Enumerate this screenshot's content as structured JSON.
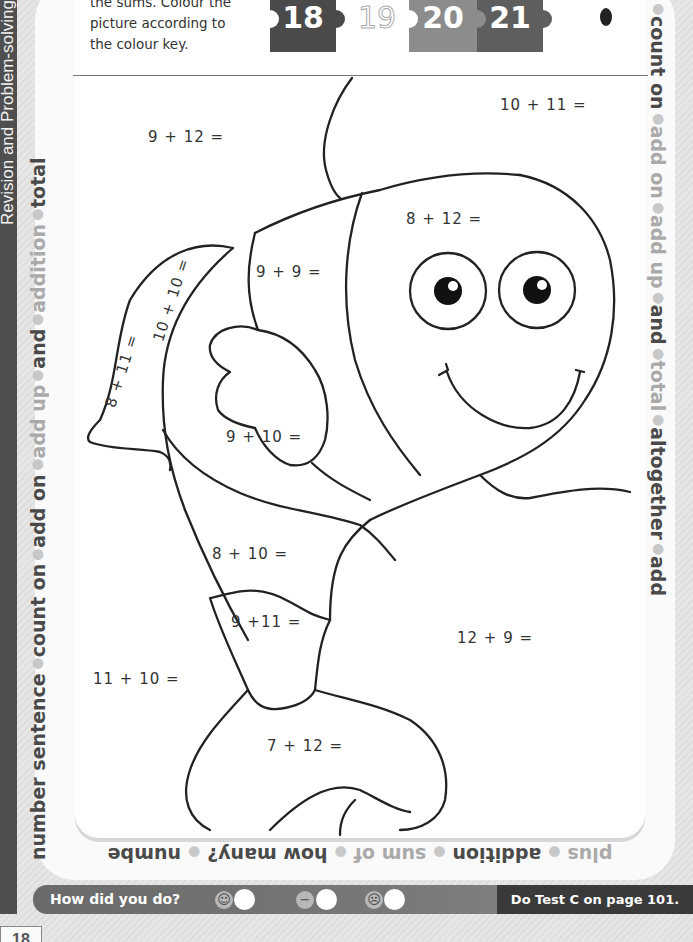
{
  "page": {
    "section_title": "Revision and Problem-solving",
    "page_number": "18"
  },
  "instructions": {
    "text_line1": "the sums. Colour the",
    "text_line2": "picture according to",
    "text_line3": "the colour key."
  },
  "colour_key": [
    {
      "value": "18",
      "color": "#4a4a4a",
      "style": "filled"
    },
    {
      "value": "19",
      "color": "#ffffff",
      "style": "outline"
    },
    {
      "value": "20",
      "color": "#8c8c8c",
      "style": "filled"
    },
    {
      "value": "21",
      "color": "#5e5e5e",
      "style": "filled"
    }
  ],
  "sums": [
    {
      "id": "s1",
      "text": "9 + 12 ="
    },
    {
      "id": "s2",
      "text": "10 + 11 ="
    },
    {
      "id": "s3",
      "text": "8 + 12 ="
    },
    {
      "id": "s4",
      "text": "9 + 9 ="
    },
    {
      "id": "s5",
      "text": "10 + 10 ="
    },
    {
      "id": "s6",
      "text": "8 + 11 ="
    },
    {
      "id": "s7",
      "text": "9 + 10 ="
    },
    {
      "id": "s8",
      "text": "8 + 10 ="
    },
    {
      "id": "s9",
      "text": "9 +11 ="
    },
    {
      "id": "s10",
      "text": "11 + 10 ="
    },
    {
      "id": "s11",
      "text": "12 + 9 ="
    },
    {
      "id": "s12",
      "text": "7 + 12 ="
    }
  ],
  "border_words": {
    "left": [
      "number sentence",
      "count on",
      "add on",
      "add up",
      "and",
      "addition",
      "total"
    ],
    "right": [
      "count on",
      "add on",
      "add up",
      "and",
      "total",
      "altogether",
      "add"
    ],
    "bottom": [
      "plus",
      "addition",
      "sum of",
      "how many?",
      "numbe"
    ]
  },
  "footer": {
    "question": "How did you do?",
    "faces": [
      "☺",
      "−",
      "☹"
    ],
    "next_step": "Do Test C on page 101."
  }
}
